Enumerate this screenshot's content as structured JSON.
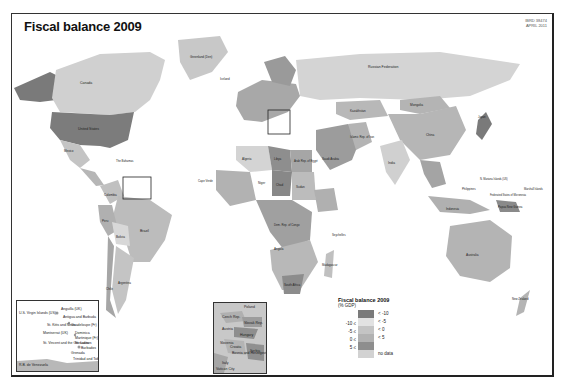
{
  "header": {
    "title": "Fiscal balance 2009",
    "map_id_line1": "IBRD 38474",
    "map_id_line2": "APRIL 2011"
  },
  "legend": {
    "title": "Fiscal balance 2009",
    "subtitle": "(% GDP)",
    "classes": [
      {
        "low": "",
        "high": "< -10",
        "color": "#7a7a7a"
      },
      {
        "low": "-10 ≤",
        "high": "< -5",
        "color": "#e2e2e2"
      },
      {
        "low": "-5 ≤",
        "high": "< 0",
        "color": "#c4c4c4"
      },
      {
        "low": "0 ≤",
        "high": "< 5",
        "color": "#b2b2b2"
      },
      {
        "low": "5 ≤",
        "high": "",
        "color": "#8e8e8e"
      },
      {
        "low": "",
        "high": "no data",
        "color": "#d2d2d2"
      }
    ]
  },
  "map_labels": {
    "canada": "Canada",
    "united_states": "United States",
    "greenland": "Greenland (Den)",
    "iceland": "Iceland",
    "russia": "Russian Federation",
    "mongolia": "Mongolia",
    "china": "China",
    "kazakhstan": "Kazakhstan",
    "india": "India",
    "brazil": "Brazil",
    "mexico": "Mexico",
    "colombia": "Colombia",
    "peru": "Peru",
    "bolivia": "Bolivia",
    "argentina": "Argentina",
    "chile": "Chile",
    "algeria": "Algeria",
    "libya": "Libya",
    "egypt": "Arab Rep. of Egypt",
    "niger": "Niger",
    "chad": "Chad",
    "sudan": "Sudan",
    "drc": "Dem. Rep. of Congo",
    "angola": "Angola",
    "south_africa": "South Africa",
    "madagascar": "Madagascar",
    "saudi_arabia": "Saudi Arabia",
    "iran": "Islamic Rep. of Iran",
    "australia": "Australia",
    "indonesia": "Indonesia",
    "png": "Papua New Guinea",
    "new_zealand": "New Zealand",
    "japan": "Japan",
    "philippines": "Philippines",
    "the_bahamas": "The Bahamas",
    "cape_verde": "Cape Verde",
    "seychelles": "Seychelles",
    "micronesia": "Federated States of Micronesia",
    "marshall": "Marshall Islands",
    "n_mariana": "N. Mariana Islands (US)"
  },
  "insets": {
    "caribbean": [
      "U.S. Virgin Islands (US)",
      "Anguilla (UK)",
      "Antigua and Barbuda",
      "St. Kitts and Nevis",
      "Guadeloupe (Fr)",
      "Dominica",
      "Martinique (Fr)",
      "St. Lucia",
      "Barbados",
      "St. Vincent and the Grenadines",
      "Grenada",
      "Trinidad and Tobago",
      "R.B. de Venezuela",
      "Montserrat (UK)"
    ],
    "europe": [
      "Poland",
      "Czech Rep.",
      "Slovak Rep.",
      "Austria",
      "Hungary",
      "Slovenia",
      "Croatia",
      "Bosnia and Herzegovina",
      "Serbia",
      "Italy",
      "Vatican City"
    ]
  }
}
